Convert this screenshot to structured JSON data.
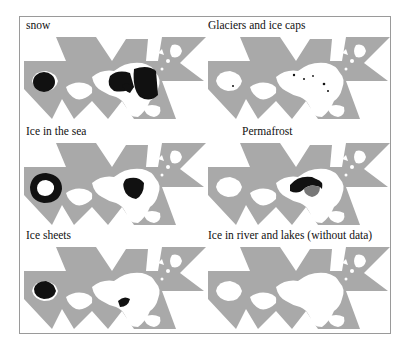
{
  "figure": {
    "panels": [
      {
        "id": "snow",
        "title": "snow",
        "overlay": "snow"
      },
      {
        "id": "glaciers",
        "title": "Glaciers and ice caps",
        "overlay": "glaciers"
      },
      {
        "id": "sea-ice",
        "title": "Ice in the sea",
        "overlay": "seaice"
      },
      {
        "id": "permafrost",
        "title": "Permafrost",
        "overlay": "permafrost"
      },
      {
        "id": "ice-sheets",
        "title": "Ice sheets",
        "overlay": "icesheets"
      },
      {
        "id": "river-lake-ice",
        "title": "Ice in river and lakes (without data)",
        "overlay": "none"
      }
    ],
    "colors": {
      "ocean": "#a9a9a9",
      "land": "#ffffff",
      "cryosphere": "#111111",
      "frame": "#9a9a9a"
    }
  }
}
